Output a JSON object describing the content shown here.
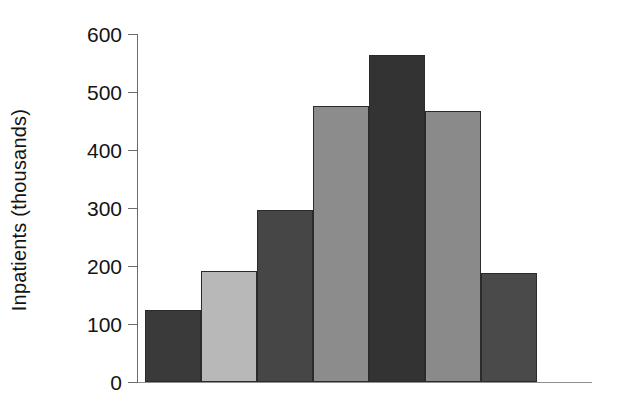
{
  "chart_data": {
    "type": "bar",
    "title": "",
    "subtitle": "",
    "xlabel": "",
    "ylabel": "Inpatients (thousands)",
    "categories": [
      "",
      "",
      "",
      "",
      "",
      "",
      ""
    ],
    "values": [
      125,
      192,
      297,
      476,
      564,
      467,
      188
    ],
    "series": [
      {
        "name": "Inpatients",
        "values": [
          125,
          192,
          297,
          476,
          564,
          467,
          188
        ]
      }
    ],
    "bar_colors": [
      "#3a3a3a",
      "#b8b8b8",
      "#464646",
      "#8c8c8c",
      "#333333",
      "#8a8a8a",
      "#4a4a4a"
    ],
    "bar_border_color": "#2b2b2b",
    "ylim": [
      0,
      600
    ],
    "yticks": [
      0,
      100,
      200,
      300,
      400,
      500,
      600
    ],
    "ytick_labels": [
      "0",
      "100",
      "200",
      "300",
      "400",
      "500",
      "600"
    ],
    "xticks": [],
    "xtick_labels": [],
    "grid": false,
    "legend": false,
    "legend_position": "none",
    "annotations": []
  },
  "axis": {
    "y_title": "Inpatients (thousands)",
    "tick_0": "0",
    "tick_100": "100",
    "tick_200": "200",
    "tick_300": "300",
    "tick_400": "400",
    "tick_500": "500",
    "tick_600": "600"
  }
}
